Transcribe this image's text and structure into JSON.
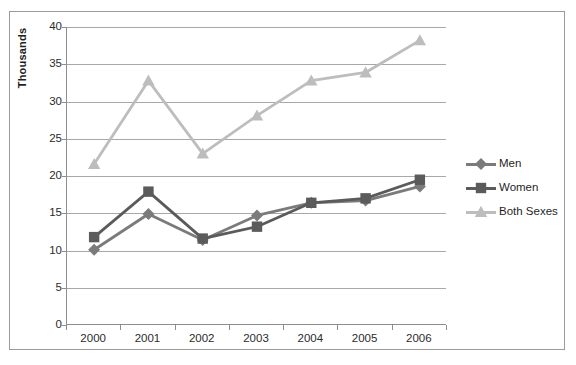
{
  "chart_data": {
    "type": "line",
    "title": "",
    "xlabel": "",
    "ylabel": "Thousands",
    "categories": [
      "2000",
      "2001",
      "2002",
      "2003",
      "2004",
      "2005",
      "2006"
    ],
    "ylim": [
      0,
      40
    ],
    "y_ticks": [
      0,
      5,
      10,
      15,
      20,
      25,
      30,
      35,
      40
    ],
    "y_tick_labels": [
      "0",
      "5",
      "10",
      "15",
      "20",
      "25",
      "30",
      "35",
      "40"
    ],
    "grid": "horizontal",
    "legend_position": "right",
    "series": [
      {
        "name": "Men",
        "color": "#7b7b7b",
        "marker": "diamond",
        "values": [
          10.1,
          14.9,
          11.4,
          14.7,
          16.4,
          16.7,
          18.6
        ]
      },
      {
        "name": "Women",
        "color": "#5b5b5b",
        "marker": "square",
        "values": [
          11.8,
          17.9,
          11.6,
          13.2,
          16.4,
          17.0,
          19.5
        ]
      },
      {
        "name": "Both Sexes",
        "color": "#bdbdbd",
        "marker": "triangle",
        "values": [
          21.6,
          32.8,
          23.0,
          28.1,
          32.8,
          33.9,
          38.2
        ]
      }
    ]
  },
  "legend": {
    "items": [
      {
        "label": "Men"
      },
      {
        "label": "Women"
      },
      {
        "label": "Both Sexes"
      }
    ]
  },
  "axes": {
    "y_title": "Thousands"
  },
  "colors": {
    "men": "#7b7b7b",
    "women": "#5b5b5b",
    "both_sexes": "#bdbdbd",
    "gridline": "#a8a8a8",
    "axis": "#8d8d8d",
    "frame": "#9a9a9a",
    "text": "#1f1f1f"
  }
}
